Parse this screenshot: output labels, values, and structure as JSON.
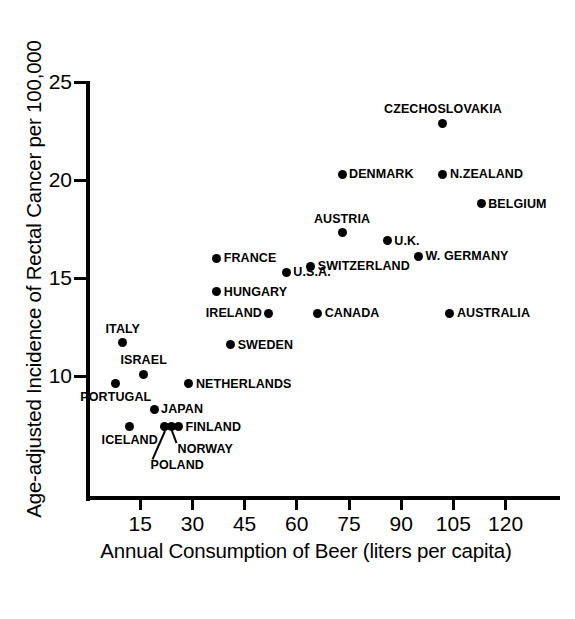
{
  "chart_data": {
    "type": "scatter",
    "title": "",
    "xlabel": "Annual Consumption of Beer (liters per capita)",
    "ylabel": "Age-adjusted Incidence of Rectal Cancer per 100,000",
    "xlim": [
      0,
      136
    ],
    "ylim": [
      6.1,
      25
    ],
    "xticks": [
      15,
      30,
      45,
      60,
      75,
      90,
      105,
      120
    ],
    "yticks": [
      10,
      15,
      20,
      25
    ],
    "grid": false,
    "legend": "none",
    "point_color": "#000000",
    "axis_color": "#000000",
    "points": [
      {
        "label": "CZECHOSLOVAKIA",
        "x": 102,
        "y": 22.9,
        "pos": "above"
      },
      {
        "label": "DENMARK",
        "x": 73,
        "y": 20.3,
        "pos": "right"
      },
      {
        "label": "N.ZEALAND",
        "x": 102,
        "y": 20.3,
        "pos": "right"
      },
      {
        "label": "BELGIUM",
        "x": 113,
        "y": 18.8,
        "pos": "right"
      },
      {
        "label": "AUSTRIA",
        "x": 73,
        "y": 17.3,
        "pos": "above"
      },
      {
        "label": "U.K.",
        "x": 86,
        "y": 16.9,
        "pos": "right"
      },
      {
        "label": "FRANCE",
        "x": 37,
        "y": 16.0,
        "pos": "right"
      },
      {
        "label": "W. GERMANY",
        "x": 95,
        "y": 16.1,
        "pos": "right"
      },
      {
        "label": "SWITZERLAND",
        "x": 64,
        "y": 15.6,
        "pos": "right"
      },
      {
        "label": "U.S.A.",
        "x": 57,
        "y": 15.3,
        "pos": "right"
      },
      {
        "label": "HUNGARY",
        "x": 37,
        "y": 14.3,
        "pos": "right"
      },
      {
        "label": "IRELAND",
        "x": 52,
        "y": 13.2,
        "pos": "left"
      },
      {
        "label": "CANADA",
        "x": 66,
        "y": 13.2,
        "pos": "right"
      },
      {
        "label": "AUSTRALIA",
        "x": 104,
        "y": 13.2,
        "pos": "right"
      },
      {
        "label": "SWEDEN",
        "x": 41,
        "y": 11.6,
        "pos": "right"
      },
      {
        "label": "ITALY",
        "x": 10,
        "y": 11.7,
        "pos": "above"
      },
      {
        "label": "ISRAEL",
        "x": 16,
        "y": 10.1,
        "pos": "above"
      },
      {
        "label": "PORTUGAL",
        "x": 8,
        "y": 9.6,
        "pos": "below"
      },
      {
        "label": "NETHERLANDS",
        "x": 29,
        "y": 9.6,
        "pos": "right"
      },
      {
        "label": "JAPAN",
        "x": 19,
        "y": 8.3,
        "pos": "right"
      },
      {
        "label": "FINLAND",
        "x": 26,
        "y": 7.4,
        "pos": "right"
      },
      {
        "label": "ICELAND",
        "x": 12,
        "y": 7.4,
        "pos": "below"
      },
      {
        "label": "NORWAY",
        "x": 24,
        "y": 7.4,
        "pos": "leader"
      },
      {
        "label": "POLAND",
        "x": 22,
        "y": 7.4,
        "pos": "leader"
      }
    ]
  }
}
